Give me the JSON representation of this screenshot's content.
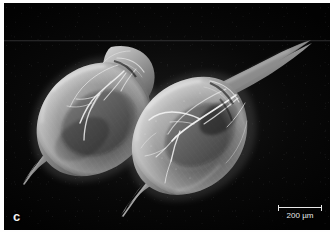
{
  "figure": {
    "kind": "sem-micrograph",
    "panel_label": "c",
    "background_color": "#000000",
    "plate_width": 326,
    "plate_height": 227
  },
  "scalebar": {
    "label": "200 µm",
    "value": 200,
    "unit": "µm",
    "bar_length_px": 44,
    "color": "#e8e8e8",
    "position": "bottom-right"
  },
  "annotations": {
    "panel_letter": "c",
    "panel_letter_color": "#f2f2f2",
    "panel_letter_position": "bottom-left"
  },
  "specimens": [
    {
      "id": "specimen-left",
      "name": "cladoceran-carapace-left",
      "description": "ovoid leaf-shaped bivalved carapace with posterior tail spine, oriented upper-right head",
      "orientation_deg": -35,
      "fill_light": "#b9b9b9",
      "fill_dark": "#4e4e4e"
    },
    {
      "id": "specimen-right",
      "name": "cladoceran-carapace-right",
      "description": "ovoid leaf-shaped bivalved carapace with long pointed rostrum and posterior tail spine",
      "orientation_deg": -38,
      "fill_light": "#c4c4c4",
      "fill_dark": "#474747"
    }
  ]
}
